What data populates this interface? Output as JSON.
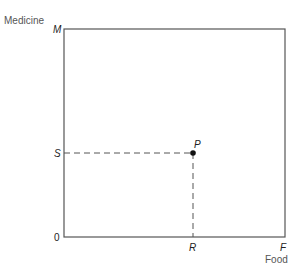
{
  "diagram": {
    "y_axis_title": "Medicine",
    "x_axis_title": "Food",
    "origin_label": "0",
    "y_max_label": "M",
    "x_max_label": "F",
    "point_label": "P",
    "point_y_label": "S",
    "point_x_label": "R",
    "colors": {
      "line": "#555555",
      "point": "#111111",
      "dash": "#555555"
    }
  }
}
